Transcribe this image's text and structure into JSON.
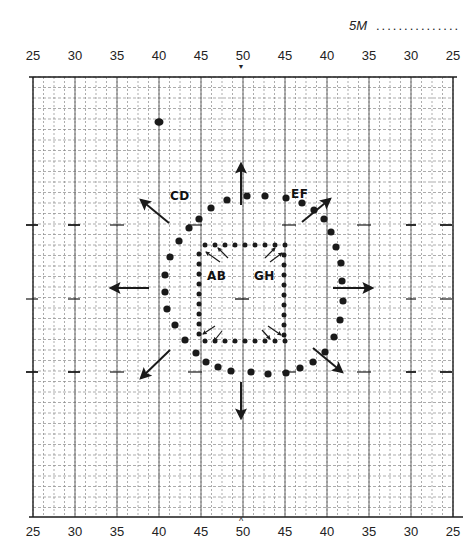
{
  "header": {
    "scale_label": "5M",
    "scale_dots": "..............."
  },
  "axes": {
    "top_ticks": [
      "25",
      "30",
      "35",
      "40",
      "45",
      "50",
      "45",
      "40",
      "35",
      "30",
      "25"
    ],
    "bottom_ticks": [
      "25",
      "30",
      "35",
      "40",
      "45",
      "50",
      "45",
      "40",
      "35",
      "30",
      "25"
    ],
    "center_marker_top": "▼",
    "center_marker_bottom": "^"
  },
  "labels": {
    "cd": "CD",
    "ef": "EF",
    "ab": "AB",
    "gh": "GH"
  },
  "colors": {
    "ink": "#1a1a1a",
    "grid_major": "#555555",
    "grid_minor": "#8a8a8a",
    "paper": "#ffffff"
  },
  "chart_data": {
    "type": "scatter",
    "title": "5M",
    "xlabel": "",
    "ylabel": "",
    "grid": true,
    "x_tick_labels": [
      "25",
      "30",
      "35",
      "40",
      "45",
      "50",
      "45",
      "40",
      "35",
      "30",
      "25"
    ],
    "outer_ring_points": [
      [
        199,
        219
      ],
      [
        211,
        208
      ],
      [
        227,
        200
      ],
      [
        247,
        196
      ],
      [
        265,
        196
      ],
      [
        286,
        198
      ],
      [
        302,
        203
      ],
      [
        314,
        210
      ],
      [
        324,
        219
      ],
      [
        331,
        232
      ],
      [
        336,
        247
      ],
      [
        341,
        263
      ],
      [
        342,
        281
      ],
      [
        343,
        301
      ],
      [
        340,
        320
      ],
      [
        334,
        337
      ],
      [
        325,
        352
      ],
      [
        313,
        362
      ],
      [
        300,
        368
      ],
      [
        286,
        373
      ],
      [
        268,
        374
      ],
      [
        251,
        372
      ],
      [
        231,
        371
      ],
      [
        218,
        367
      ],
      [
        206,
        362
      ],
      [
        196,
        353
      ],
      [
        185,
        340
      ],
      [
        175,
        325
      ],
      [
        167,
        309
      ],
      [
        165,
        292
      ],
      [
        165,
        275
      ],
      [
        170,
        257
      ],
      [
        179,
        241
      ],
      [
        189,
        228
      ]
    ],
    "inner_square_points": [
      [
        205,
        245
      ],
      [
        215,
        245
      ],
      [
        225,
        245
      ],
      [
        235,
        245
      ],
      [
        245,
        245
      ],
      [
        255,
        245
      ],
      [
        265,
        245
      ],
      [
        275,
        245
      ],
      [
        285,
        245
      ],
      [
        199,
        254
      ],
      [
        199,
        264
      ],
      [
        199,
        274
      ],
      [
        199,
        284
      ],
      [
        199,
        294
      ],
      [
        199,
        304
      ],
      [
        199,
        314
      ],
      [
        199,
        324
      ],
      [
        199,
        334
      ],
      [
        284,
        255
      ],
      [
        284,
        265
      ],
      [
        284,
        275
      ],
      [
        284,
        285
      ],
      [
        284,
        295
      ],
      [
        284,
        305
      ],
      [
        284,
        315
      ],
      [
        284,
        325
      ],
      [
        284,
        335
      ],
      [
        205,
        341
      ],
      [
        215,
        341
      ],
      [
        225,
        341
      ],
      [
        235,
        341
      ],
      [
        245,
        341
      ],
      [
        255,
        341
      ],
      [
        265,
        341
      ],
      [
        275,
        341
      ],
      [
        285,
        341
      ]
    ],
    "outward_arrows": [
      {
        "dir": "N",
        "from": [
          241,
          205
        ],
        "to": [
          241,
          164
        ]
      },
      {
        "dir": "NE",
        "from": [
          302,
          222
        ],
        "to": [
          330,
          199
        ]
      },
      {
        "dir": "E",
        "from": [
          333,
          288
        ],
        "to": [
          372,
          288
        ]
      },
      {
        "dir": "SE",
        "from": [
          313,
          348
        ],
        "to": [
          342,
          372
        ]
      },
      {
        "dir": "S",
        "from": [
          241,
          382
        ],
        "to": [
          241,
          418
        ]
      },
      {
        "dir": "SW",
        "from": [
          170,
          350
        ],
        "to": [
          141,
          378
        ]
      },
      {
        "dir": "W",
        "from": [
          149,
          288
        ],
        "to": [
          111,
          288
        ]
      },
      {
        "dir": "NW",
        "from": [
          169,
          223
        ],
        "to": [
          141,
          200
        ]
      }
    ],
    "inner_arrows": [
      {
        "corner": "NW",
        "from": [
          220,
          262
        ],
        "to": [
          206,
          252
        ]
      },
      {
        "corner": "NW",
        "from": [
          228,
          258
        ],
        "to": [
          218,
          248
        ]
      },
      {
        "corner": "NE",
        "from": [
          265,
          258
        ],
        "to": [
          275,
          248
        ]
      },
      {
        "corner": "NE",
        "from": [
          270,
          262
        ],
        "to": [
          282,
          253
        ]
      },
      {
        "corner": "SW",
        "from": [
          215,
          326
        ],
        "to": [
          203,
          334
        ]
      },
      {
        "corner": "SW",
        "from": [
          222,
          331
        ],
        "to": [
          214,
          341
        ]
      },
      {
        "corner": "SE",
        "from": [
          262,
          330
        ],
        "to": [
          270,
          339
        ]
      },
      {
        "corner": "SE",
        "from": [
          268,
          326
        ],
        "to": [
          281,
          335
        ]
      }
    ],
    "annotations": [
      {
        "text": "CD",
        "x": 176,
        "y": 199
      },
      {
        "text": "EF",
        "x": 296,
        "y": 197
      },
      {
        "text": "AB",
        "x": 217,
        "y": 279
      },
      {
        "text": "GH",
        "x": 262,
        "y": 279
      }
    ],
    "marks": [
      {
        "type": "blob",
        "x": 159,
        "y": 122
      }
    ]
  }
}
